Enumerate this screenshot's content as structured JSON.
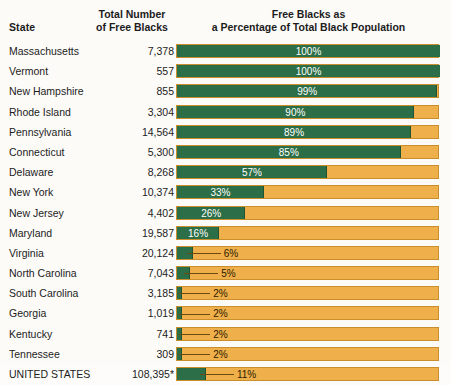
{
  "header": {
    "state_label": "State",
    "total_line1": "Total Number",
    "total_line2": "of Free Blacks",
    "pct_line1": "Free Blacks as",
    "pct_line2": "a Percentage of Total Black Population"
  },
  "colors": {
    "free_green": "#2c6e47",
    "enslaved_orange": "#efaf4a",
    "background": "#fcfbf8",
    "label_light": "#ffffff",
    "label_dark": "#2b2000"
  },
  "chart_data": {
    "type": "bar",
    "title": "Free Blacks as a Percentage of Total Black Population",
    "xlabel": "",
    "ylabel": "State",
    "xlim": [
      0,
      100
    ],
    "grid": false,
    "legend": [],
    "categories": [
      "Massachusetts",
      "Vermont",
      "New Hampshire",
      "Rhode Island",
      "Pennsylvania",
      "Connecticut",
      "Delaware",
      "New York",
      "New Jersey",
      "Maryland",
      "Virginia",
      "North Carolina",
      "South Carolina",
      "Georgia",
      "Kentucky",
      "Tennessee",
      "UNITED STATES"
    ],
    "values": [
      100,
      100,
      99,
      90,
      89,
      85,
      57,
      33,
      26,
      16,
      6,
      5,
      2,
      2,
      2,
      2,
      11
    ],
    "value_labels": [
      "100%",
      "100%",
      "99%",
      "90%",
      "89%",
      "85%",
      "57%",
      "33%",
      "26%",
      "16%",
      "6%",
      "5%",
      "2%",
      "2%",
      "2%",
      "2%",
      "11%"
    ],
    "total_free_blacks": [
      "7,378",
      "557",
      "855",
      "3,304",
      "14,564",
      "5,300",
      "8,268",
      "10,374",
      "4,402",
      "19,587",
      "20,124",
      "7,043",
      "3,185",
      "1,019",
      "741",
      "309",
      "108,395*"
    ]
  },
  "rows": [
    {
      "state": "Massachusetts",
      "total": "7,378",
      "pct": 100,
      "label": "100%",
      "style": "inside"
    },
    {
      "state": "Vermont",
      "total": "557",
      "pct": 100,
      "label": "100%",
      "style": "inside"
    },
    {
      "state": "New Hampshire",
      "total": "855",
      "pct": 99,
      "label": "99%",
      "style": "inside"
    },
    {
      "state": "Rhode Island",
      "total": "3,304",
      "pct": 90,
      "label": "90%",
      "style": "inside"
    },
    {
      "state": "Pennsylvania",
      "total": "14,564",
      "pct": 89,
      "label": "89%",
      "style": "inside"
    },
    {
      "state": "Connecticut",
      "total": "5,300",
      "pct": 85,
      "label": "85%",
      "style": "inside"
    },
    {
      "state": "Delaware",
      "total": "8,268",
      "pct": 57,
      "label": "57%",
      "style": "inside"
    },
    {
      "state": "New York",
      "total": "10,374",
      "pct": 33,
      "label": "33%",
      "style": "inside"
    },
    {
      "state": "New Jersey",
      "total": "4,402",
      "pct": 26,
      "label": "26%",
      "style": "inside"
    },
    {
      "state": "Maryland",
      "total": "19,587",
      "pct": 16,
      "label": "16%",
      "style": "inside"
    },
    {
      "state": "Virginia",
      "total": "20,124",
      "pct": 6,
      "label": "6%",
      "style": "leader"
    },
    {
      "state": "North Carolina",
      "total": "7,043",
      "pct": 5,
      "label": "5%",
      "style": "leader"
    },
    {
      "state": "South Carolina",
      "total": "3,185",
      "pct": 2,
      "label": "2%",
      "style": "leader"
    },
    {
      "state": "Georgia",
      "total": "1,019",
      "pct": 2,
      "label": "2%",
      "style": "leader"
    },
    {
      "state": "Kentucky",
      "total": "741",
      "pct": 2,
      "label": "2%",
      "style": "leader"
    },
    {
      "state": "Tennessee",
      "total": "309",
      "pct": 2,
      "label": "2%",
      "style": "leader"
    },
    {
      "state": "UNITED STATES",
      "total": "108,395*",
      "pct": 11,
      "label": "11%",
      "style": "leader"
    }
  ]
}
